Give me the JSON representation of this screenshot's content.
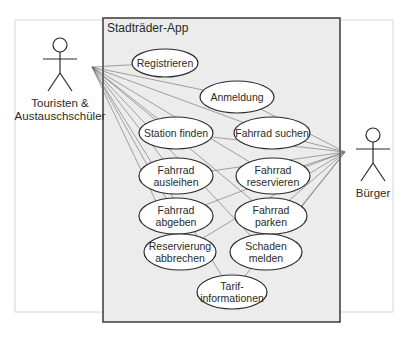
{
  "diagram": {
    "type": "uml-use-case",
    "system": {
      "title": "Stadträder-App",
      "box": {
        "x": 103,
        "y": 18,
        "w": 237,
        "h": 304
      },
      "fill": "#ececec",
      "stroke": "#3a3a3a"
    },
    "frame": {
      "x": 15,
      "y": 20,
      "w": 378,
      "h": 292,
      "stroke": "#d6d6d6"
    },
    "actors": [
      {
        "id": "tourists",
        "label_lines": [
          "Touristen &",
          "Austauschschüler"
        ],
        "x": 60,
        "head_y": 45,
        "anchor": [
          92,
          67
        ]
      },
      {
        "id": "citizen",
        "label_lines": [
          "Bürger"
        ],
        "x": 373,
        "head_y": 135,
        "anchor": [
          345,
          152
        ]
      }
    ],
    "use_cases": [
      {
        "id": "registrieren",
        "lines": [
          "Registrieren"
        ],
        "cx": 165,
        "cy": 63,
        "rx": 33,
        "ry": 14
      },
      {
        "id": "anmeldung",
        "lines": [
          "Anmeldung"
        ],
        "cx": 237,
        "cy": 97,
        "rx": 37,
        "ry": 16
      },
      {
        "id": "station-finden",
        "lines": [
          "Station finden"
        ],
        "cx": 176,
        "cy": 133,
        "rx": 37,
        "ry": 16
      },
      {
        "id": "fahrrad-suchen",
        "lines": [
          "Fahrrad suchen"
        ],
        "cx": 272,
        "cy": 133,
        "rx": 38,
        "ry": 16
      },
      {
        "id": "fahrrad-ausleihen",
        "lines": [
          "Fahrrad",
          "ausleihen"
        ],
        "cx": 176,
        "cy": 176,
        "rx": 37,
        "ry": 18
      },
      {
        "id": "fahrrad-reservieren",
        "lines": [
          "Fahrrad",
          "reservieren"
        ],
        "cx": 273,
        "cy": 176,
        "rx": 37,
        "ry": 18
      },
      {
        "id": "fahrrad-abgeben",
        "lines": [
          "Fahrrad",
          "abgeben"
        ],
        "cx": 176,
        "cy": 216,
        "rx": 37,
        "ry": 18
      },
      {
        "id": "fahrrad-parken",
        "lines": [
          "Fahrrad",
          "parken"
        ],
        "cx": 271,
        "cy": 216,
        "rx": 36,
        "ry": 18
      },
      {
        "id": "reservierung-abbrechen",
        "lines": [
          "Reservierung",
          "abbrechen"
        ],
        "cx": 180,
        "cy": 252,
        "rx": 36,
        "ry": 18
      },
      {
        "id": "schaden-melden",
        "lines": [
          "Schaden",
          "melden"
        ],
        "cx": 266,
        "cy": 252,
        "rx": 36,
        "ry": 18
      },
      {
        "id": "tarifinformationen",
        "lines": [
          "Tarif-",
          "informationen"
        ],
        "cx": 232,
        "cy": 292,
        "rx": 35,
        "ry": 17
      }
    ],
    "associations": {
      "tourists": [
        "registrieren",
        "anmeldung",
        "station-finden",
        "fahrrad-suchen",
        "fahrrad-ausleihen",
        "fahrrad-reservieren",
        "fahrrad-abgeben",
        "fahrrad-parken",
        "reservierung-abbrechen",
        "schaden-melden",
        "tarifinformationen"
      ],
      "citizen": [
        "anmeldung",
        "station-finden",
        "fahrrad-suchen",
        "fahrrad-ausleihen",
        "fahrrad-reservieren",
        "fahrrad-abgeben",
        "fahrrad-parken",
        "reservierung-abbrechen",
        "schaden-melden",
        "tarifinformationen"
      ]
    },
    "colors": {
      "line": "#6a6a6a",
      "ellipse_fill": "#ffffff",
      "ellipse_stroke": "#2a2a2a",
      "text": "#2a2a2a"
    }
  }
}
